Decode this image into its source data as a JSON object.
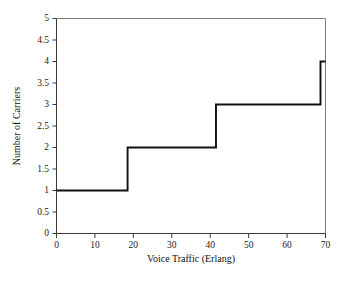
{
  "chart_data": {
    "type": "line",
    "subtype": "step-post",
    "title": "",
    "subtitle": "",
    "xlabel": "Voice Traffic (Erlang)",
    "ylabel": "Number of Carriers",
    "xlim": [
      0,
      70
    ],
    "ylim": [
      0,
      5
    ],
    "grid": false,
    "legend": null,
    "legend_position": "none",
    "xticks": [
      0,
      10,
      20,
      30,
      40,
      50,
      60,
      70
    ],
    "xtick_labels": [
      "0",
      "10",
      "20",
      "30",
      "40",
      "50",
      "60",
      "70"
    ],
    "yticks": [
      0,
      0.5,
      1,
      1.5,
      2,
      2.5,
      3,
      3.5,
      4,
      4.5,
      5
    ],
    "ytick_labels": [
      "0",
      "0.5",
      "1",
      "1.5",
      "2",
      "2.5",
      "3",
      "3.5",
      "4",
      "4.5",
      "5"
    ],
    "series": [
      {
        "name": "Number of Carriers",
        "color": "#111111",
        "steps": [
          {
            "x_start": 0,
            "x_end": 18.5,
            "y": 1
          },
          {
            "x_start": 18.5,
            "x_end": 41.5,
            "y": 2
          },
          {
            "x_start": 41.5,
            "x_end": 68.7,
            "y": 3
          },
          {
            "x_start": 68.7,
            "x_end": 70,
            "y": 4
          }
        ],
        "x": [
          0,
          18.5,
          18.5,
          41.5,
          41.5,
          68.7,
          68.7,
          70
        ],
        "y": [
          1,
          1,
          2,
          2,
          3,
          3,
          4,
          4
        ],
        "transition_points": [
          {
            "x": 18.5,
            "from": 1,
            "to": 2
          },
          {
            "x": 41.5,
            "from": 2,
            "to": 3
          },
          {
            "x": 68.7,
            "from": 3,
            "to": 4
          }
        ]
      }
    ],
    "annotations": [],
    "colors": {
      "line": "#111111",
      "axis": "#3a3a3a",
      "frame": "#5a5a5a",
      "text": "#1c1c1c",
      "background": "#ffffff"
    }
  }
}
